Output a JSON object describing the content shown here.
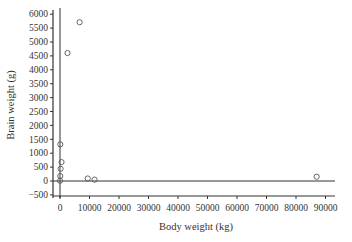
{
  "chart_data": {
    "type": "scatter",
    "title": "",
    "xlabel": "Body weight (kg)",
    "ylabel": "Brain weight (g)",
    "xlim": [
      -2000,
      92000
    ],
    "ylim": [
      -600,
      6200
    ],
    "x_ticks": [
      0,
      10000,
      20000,
      30000,
      40000,
      50000,
      60000,
      70000,
      80000,
      90000
    ],
    "x_tick_labels": [
      "0",
      "10000",
      "20000",
      "30000",
      "40000",
      "50000",
      "60000",
      "70000",
      "80000",
      "90000"
    ],
    "y_ticks": [
      -500,
      0,
      500,
      1000,
      1500,
      2000,
      2500,
      3000,
      3500,
      4000,
      4500,
      5000,
      5500,
      6000
    ],
    "y_tick_labels": [
      "-500",
      "0",
      "500",
      "1000",
      "1500",
      "2000",
      "2500",
      "3000",
      "3500",
      "4000",
      "4500",
      "5000",
      "5500",
      "6000"
    ],
    "grid": false,
    "reference_lines": {
      "x_zero": true,
      "y_zero": true
    },
    "marker": "open-circle",
    "series": [
      {
        "name": "animals",
        "points": [
          {
            "x": 6654,
            "y": 5712
          },
          {
            "x": 2547,
            "y": 4603
          },
          {
            "x": 100,
            "y": 1320
          },
          {
            "x": 520,
            "y": 680
          },
          {
            "x": 200,
            "y": 440
          },
          {
            "x": 100,
            "y": 180
          },
          {
            "x": 30,
            "y": 10
          },
          {
            "x": 9400,
            "y": 90
          },
          {
            "x": 11700,
            "y": 50
          },
          {
            "x": 87000,
            "y": 154
          }
        ]
      }
    ]
  },
  "colors": {
    "axis": "#333333",
    "marker": "#555555"
  }
}
